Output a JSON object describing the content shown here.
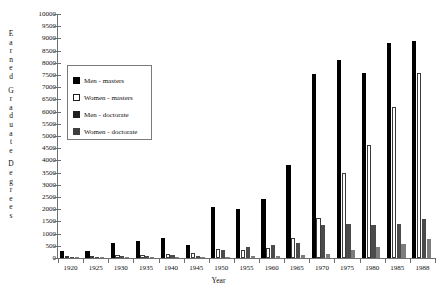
{
  "chart_data": {
    "type": "bar",
    "title": "",
    "xlabel": "Year",
    "ylabel": "Earned Graduate Degrees",
    "ylim": [
      0,
      10000
    ],
    "ytick_step": 500,
    "yticks": [
      10000,
      9500,
      9000,
      8500,
      8000,
      7500,
      7000,
      6500,
      6000,
      5500,
      5000,
      4500,
      4000,
      3500,
      3000,
      2500,
      2000,
      1500,
      1000,
      500,
      0
    ],
    "grid": false,
    "legend_position": "inside-upper-left",
    "categories": [
      "1920",
      "1925",
      "1930",
      "1935",
      "1940",
      "1945",
      "1950",
      "1955",
      "1960",
      "1965",
      "1970",
      "1975",
      "1980",
      "1985",
      "1988"
    ],
    "series": [
      {
        "name": "Men - masters",
        "color": "#000000",
        "values": [
          280,
          300,
          600,
          700,
          800,
          550,
          2100,
          2000,
          2400,
          3800,
          7550,
          8100,
          7600,
          8800,
          8900
        ]
      },
      {
        "name": "Women - masters",
        "color": "#ffffff",
        "values": [
          60,
          70,
          120,
          140,
          170,
          200,
          380,
          330,
          420,
          800,
          1650,
          3500,
          4650,
          6200,
          7600
        ]
      },
      {
        "name": "Men - doctorate",
        "color": "#4b4b4b",
        "values": [
          30,
          40,
          80,
          100,
          120,
          90,
          330,
          450,
          520,
          600,
          1350,
          1400,
          1350,
          1380,
          1600
        ]
      },
      {
        "name": "Women - doctorate",
        "color": "#7d7d7d",
        "values": [
          10,
          12,
          20,
          25,
          30,
          25,
          60,
          70,
          90,
          120,
          180,
          330,
          440,
          560,
          780
        ]
      }
    ]
  },
  "legend": {
    "items": [
      {
        "label": "Men - masters"
      },
      {
        "label": "Women - masters"
      },
      {
        "label": "Men - doctorate"
      },
      {
        "label": "Women - doctorate"
      }
    ]
  },
  "axes": {
    "y_title_letters": [
      [
        "E",
        "a",
        "r",
        "n",
        "e",
        "d"
      ],
      [
        "G",
        "r",
        "a",
        "d",
        "u",
        "a",
        "t",
        "e"
      ],
      [
        "D",
        "e",
        "g",
        "r",
        "e",
        "e",
        "s"
      ]
    ],
    "x_title": "Year"
  }
}
